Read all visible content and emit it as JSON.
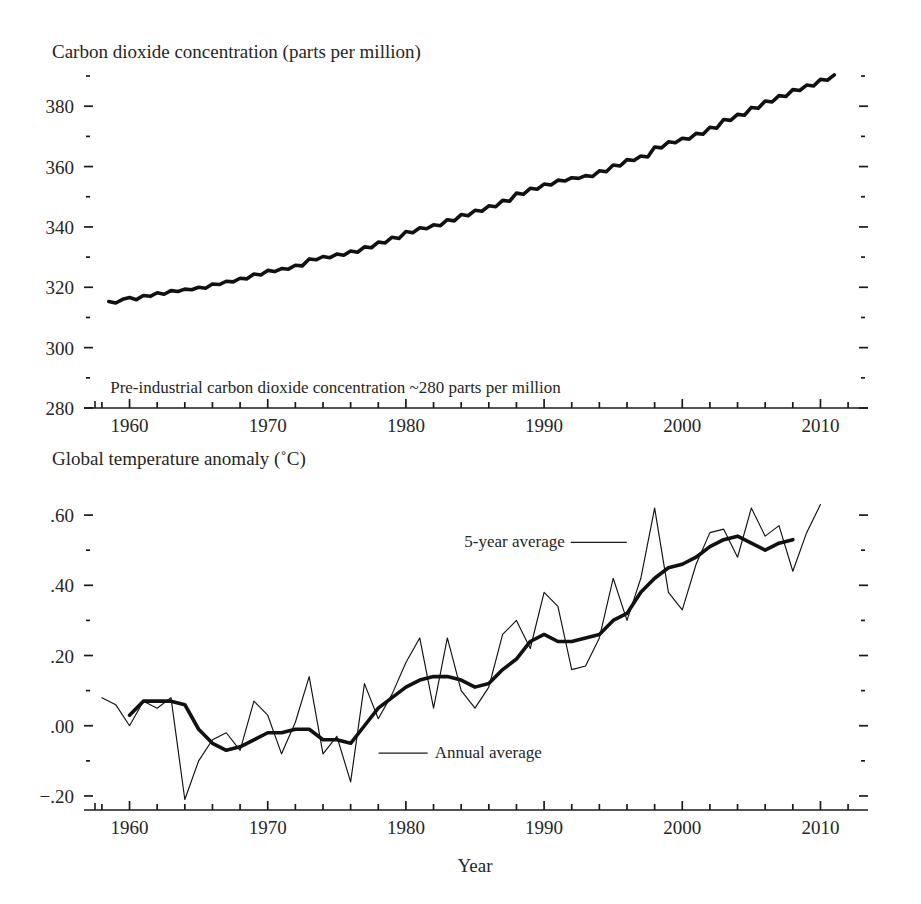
{
  "figure": {
    "xlabel": "Year",
    "x_ticks": [
      "1960",
      "1970",
      "1980",
      "1990",
      "2000",
      "2010"
    ]
  },
  "chart_data": [
    {
      "type": "line",
      "title": "Carbon dioxide concentration (parts per million)",
      "xlabel": "",
      "ylabel": "Carbon dioxide concentration (parts per million)",
      "xlim": [
        1957.5,
        2012.5
      ],
      "ylim": [
        280,
        392
      ],
      "grid": false,
      "legend": "none",
      "y_ticks": [
        "280",
        "300",
        "320",
        "340",
        "360",
        "380"
      ],
      "y_tick_values": [
        280,
        300,
        320,
        340,
        360,
        380
      ],
      "y_minor_values": [
        290,
        310,
        330,
        350,
        370,
        390
      ],
      "x_ticks": [
        "1960",
        "1970",
        "1980",
        "1990",
        "2000",
        "2010"
      ],
      "x_tick_values": [
        1960,
        1970,
        1980,
        1990,
        2000,
        2010
      ],
      "x_minor_step": 2,
      "annotations": [
        {
          "text": "Pre-industrial carbon dioxide concentration ~280 parts per million",
          "x": 1958.6,
          "y": 285
        }
      ],
      "series": [
        {
          "name": "Mauna Loa monthly mean CO2",
          "x": [
            1958.5,
            1959,
            1959.5,
            1960,
            1960.5,
            1961,
            1961.5,
            1962,
            1962.5,
            1963,
            1963.5,
            1964,
            1964.5,
            1965,
            1965.5,
            1966,
            1966.5,
            1967,
            1967.5,
            1968,
            1968.5,
            1969,
            1969.5,
            1970,
            1970.5,
            1971,
            1971.5,
            1972,
            1972.5,
            1973,
            1973.5,
            1974,
            1974.5,
            1975,
            1975.5,
            1976,
            1976.5,
            1977,
            1977.5,
            1978,
            1978.5,
            1979,
            1979.5,
            1980,
            1980.5,
            1981,
            1981.5,
            1982,
            1982.5,
            1983,
            1983.5,
            1984,
            1984.5,
            1985,
            1985.5,
            1986,
            1986.5,
            1987,
            1987.5,
            1988,
            1988.5,
            1989,
            1989.5,
            1990,
            1990.5,
            1991,
            1991.5,
            1992,
            1992.5,
            1993,
            1993.5,
            1994,
            1994.5,
            1995,
            1995.5,
            1996,
            1996.5,
            1997,
            1997.5,
            1998,
            1998.5,
            1999,
            1999.5,
            2000,
            2000.5,
            2001,
            2001.5,
            2002,
            2002.5,
            2003,
            2003.5,
            2004,
            2004.5,
            2005,
            2005.5,
            2006,
            2006.5,
            2007,
            2007.5,
            2008,
            2008.5,
            2009,
            2009.5,
            2010,
            2010.5,
            2011
          ],
          "y": [
            315.3,
            314.8,
            316.0,
            316.6,
            315.9,
            317.3,
            317.0,
            318.2,
            317.7,
            318.9,
            318.6,
            319.4,
            319.2,
            320.0,
            319.7,
            321.1,
            320.9,
            322.0,
            321.8,
            323.0,
            322.8,
            324.4,
            324.1,
            325.6,
            325.2,
            326.2,
            326.0,
            327.3,
            327.1,
            329.4,
            329.1,
            330.2,
            329.8,
            331.0,
            330.6,
            332.0,
            331.6,
            333.4,
            333.1,
            335.0,
            334.7,
            336.6,
            336.2,
            338.5,
            338.1,
            339.7,
            339.4,
            340.7,
            340.4,
            342.4,
            342.0,
            344.1,
            343.7,
            345.5,
            345.2,
            347.0,
            346.7,
            348.8,
            348.5,
            351.2,
            350.8,
            352.8,
            352.5,
            354.2,
            353.9,
            355.5,
            355.2,
            356.3,
            356.1,
            357.0,
            356.7,
            358.6,
            358.3,
            360.5,
            360.2,
            362.3,
            362.0,
            363.5,
            363.2,
            366.5,
            366.2,
            368.2,
            367.9,
            369.4,
            369.1,
            371.0,
            370.7,
            373.0,
            372.7,
            375.6,
            375.3,
            377.3,
            377.0,
            379.6,
            379.3,
            381.7,
            381.4,
            383.5,
            383.2,
            385.5,
            385.2,
            387.0,
            386.7,
            388.9,
            388.6,
            390.4
          ]
        }
      ]
    },
    {
      "type": "line",
      "title": "Global temperature anomaly (˚C)",
      "xlabel": "Year",
      "ylabel": "Global temperature anomaly (˚C)",
      "xlim": [
        1957.5,
        2012.5
      ],
      "ylim": [
        -0.24,
        0.68
      ],
      "grid": false,
      "legend": "inline-annotations",
      "y_ticks": [
        "−.20",
        ".00",
        ".20",
        ".40",
        ".60"
      ],
      "y_tick_values": [
        -0.2,
        0.0,
        0.2,
        0.4,
        0.6
      ],
      "y_minor_values": [
        -0.1,
        0.1,
        0.3,
        0.5
      ],
      "x_ticks": [
        "1960",
        "1970",
        "1980",
        "1990",
        "2000",
        "2010"
      ],
      "x_tick_values": [
        1960,
        1970,
        1980,
        1990,
        2000,
        2010
      ],
      "x_minor_step": 2,
      "annotations": [
        {
          "text": "5-year average",
          "x": 1991.5,
          "y": 0.525
        },
        {
          "text": "Annual average",
          "x": 1981.5,
          "y": -0.075
        }
      ],
      "series": [
        {
          "name": "Annual average",
          "style": "thin",
          "x": [
            1958,
            1959,
            1960,
            1961,
            1962,
            1963,
            1964,
            1965,
            1966,
            1967,
            1968,
            1969,
            1970,
            1971,
            1972,
            1973,
            1974,
            1975,
            1976,
            1977,
            1978,
            1979,
            1980,
            1981,
            1982,
            1983,
            1984,
            1985,
            1986,
            1987,
            1988,
            1989,
            1990,
            1991,
            1992,
            1993,
            1994,
            1995,
            1996,
            1997,
            1998,
            1999,
            2000,
            2001,
            2002,
            2003,
            2004,
            2005,
            2006,
            2007,
            2008,
            2009,
            2010
          ],
          "y": [
            0.08,
            0.06,
            0.0,
            0.07,
            0.05,
            0.08,
            -0.21,
            -0.1,
            -0.04,
            -0.02,
            -0.07,
            0.07,
            0.03,
            -0.08,
            0.01,
            0.14,
            -0.08,
            -0.03,
            -0.16,
            0.12,
            0.02,
            0.09,
            0.18,
            0.25,
            0.05,
            0.25,
            0.1,
            0.05,
            0.11,
            0.26,
            0.3,
            0.22,
            0.38,
            0.34,
            0.16,
            0.17,
            0.25,
            0.42,
            0.3,
            0.42,
            0.62,
            0.38,
            0.33,
            0.46,
            0.55,
            0.56,
            0.48,
            0.62,
            0.54,
            0.57,
            0.44,
            0.55,
            0.63
          ]
        },
        {
          "name": "5-year average",
          "style": "thick",
          "x": [
            1960,
            1961,
            1962,
            1963,
            1964,
            1965,
            1966,
            1967,
            1968,
            1969,
            1970,
            1971,
            1972,
            1973,
            1974,
            1975,
            1976,
            1977,
            1978,
            1979,
            1980,
            1981,
            1982,
            1983,
            1984,
            1985,
            1986,
            1987,
            1988,
            1989,
            1990,
            1991,
            1992,
            1993,
            1994,
            1995,
            1996,
            1997,
            1998,
            1999,
            2000,
            2001,
            2002,
            2003,
            2004,
            2005,
            2006,
            2007,
            2008
          ],
          "y": [
            0.03,
            0.07,
            0.07,
            0.07,
            0.06,
            -0.01,
            -0.05,
            -0.07,
            -0.06,
            -0.04,
            -0.02,
            -0.02,
            -0.01,
            -0.01,
            -0.04,
            -0.04,
            -0.05,
            0.0,
            0.05,
            0.08,
            0.11,
            0.13,
            0.14,
            0.14,
            0.13,
            0.11,
            0.12,
            0.16,
            0.19,
            0.24,
            0.26,
            0.24,
            0.24,
            0.25,
            0.26,
            0.3,
            0.32,
            0.38,
            0.42,
            0.45,
            0.46,
            0.48,
            0.51,
            0.53,
            0.54,
            0.52,
            0.5,
            0.52,
            0.53
          ]
        }
      ]
    }
  ]
}
